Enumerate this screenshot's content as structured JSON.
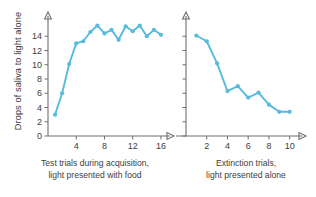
{
  "figure": {
    "ylabel": "Drops of saliva to light alone",
    "background": "#ffffff",
    "series_color": "#58BADC",
    "axis_color": "#6e6e6e"
  },
  "captions": {
    "left": "Test trials during acquisition,\nlight presented with food",
    "right": "Extinction trials,\nlight presented alone"
  },
  "chart_data": [
    {
      "type": "line",
      "title": "Test trials during acquisition, light presented with food",
      "xlabel": "",
      "ylabel": "Drops of saliva to light alone",
      "xlim": [
        0,
        17
      ],
      "ylim": [
        0,
        16
      ],
      "xticks": [
        4,
        8,
        12,
        16
      ],
      "yticks": [
        0,
        2,
        4,
        6,
        8,
        10,
        12,
        14
      ],
      "grid": false,
      "legend": "none",
      "markers": true,
      "x": [
        1,
        2,
        3,
        4,
        5,
        6,
        7,
        8,
        9,
        10,
        11,
        12,
        13,
        14,
        15,
        16
      ],
      "values": [
        3.0,
        6.0,
        10.1,
        13.0,
        13.3,
        14.6,
        15.5,
        14.4,
        14.9,
        13.5,
        15.4,
        14.7,
        15.5,
        14.0,
        14.9,
        14.2
      ]
    },
    {
      "type": "line",
      "title": "Extinction trials, light presented alone",
      "xlabel": "",
      "ylabel": "Drops of saliva to light alone",
      "xlim": [
        0,
        11
      ],
      "ylim": [
        0,
        16
      ],
      "xticks": [
        2,
        4,
        6,
        8,
        10
      ],
      "yticks": [
        0,
        2,
        4,
        6,
        8,
        10,
        12,
        14
      ],
      "grid": false,
      "legend": "none",
      "markers": true,
      "x": [
        1,
        2,
        3,
        4,
        5,
        6,
        7,
        8,
        9,
        10
      ],
      "values": [
        14.1,
        13.3,
        10.2,
        6.3,
        7.0,
        5.4,
        6.1,
        4.4,
        3.4,
        3.4
      ]
    }
  ]
}
